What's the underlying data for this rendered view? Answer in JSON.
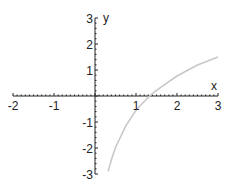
{
  "chart_data": {
    "type": "line",
    "title": "",
    "xlabel": "x",
    "ylabel": "y",
    "xlim": [
      -2,
      3
    ],
    "ylim": [
      -3,
      3
    ],
    "grid": false,
    "x_ticks": [
      "-2",
      "-1",
      "1",
      "2",
      "3"
    ],
    "y_ticks": [
      "3",
      "2",
      "1",
      "-1",
      "-2",
      "-3"
    ],
    "series": [
      {
        "name": "curve",
        "color": "#c8c8c8",
        "x": [
          0.32,
          0.4,
          0.5,
          0.75,
          1.0,
          1.33,
          1.5,
          2.0,
          2.5,
          3.0
        ],
        "y": [
          -2.9,
          -2.45,
          -1.98,
          -1.15,
          -0.55,
          0.0,
          0.22,
          0.77,
          1.19,
          1.5
        ]
      }
    ]
  }
}
